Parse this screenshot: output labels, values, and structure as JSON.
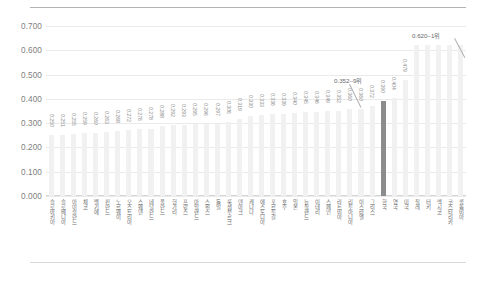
{
  "chart_data": {
    "type": "bar",
    "title": "",
    "xlabel": "",
    "ylabel": "",
    "ylim": [
      0.0,
      0.7
    ],
    "ytick_labels": [
      "0.700",
      "0.600",
      "0.500",
      "0.400",
      "0.300",
      "0.200",
      "0.100",
      "0.000"
    ],
    "ytick_values": [
      0.7,
      0.6,
      0.5,
      0.4,
      0.3,
      0.2,
      0.1,
      0.0
    ],
    "grid": true,
    "legend": "none",
    "highlight_category": "한국",
    "highlight_color": "#8c8c8c",
    "bar_color": "#f1f1f1",
    "categories": [
      "슬로바키아",
      "슬로베니아",
      "아이슬란드",
      "체코",
      "벨기에",
      "핀란드",
      "노르웨이",
      "오스트리아",
      "스웨덴",
      "네덜란드",
      "폴란드",
      "헝가리",
      "프랑스",
      "아일랜드",
      "스위스",
      "독일",
      "룩셈부르크",
      "덴마크",
      "캐나다",
      "에스토니아",
      "포르투갈",
      "호주",
      "일본",
      "뉴질랜드",
      "이태리",
      "스페인",
      "라트비아",
      "리투아니아",
      "이스라엘",
      "그리스",
      "한국",
      "영국",
      "미국",
      "칠레",
      "터키",
      "멕시코",
      "코스타리카",
      "콜롬비아"
    ],
    "values": [
      0.25,
      0.251,
      0.255,
      0.259,
      0.26,
      0.263,
      0.268,
      0.272,
      0.276,
      0.278,
      0.288,
      0.292,
      0.293,
      0.295,
      0.296,
      0.297,
      0.306,
      0.319,
      0.33,
      0.333,
      0.336,
      0.339,
      0.34,
      0.345,
      0.346,
      0.349,
      0.352,
      0.36,
      0.36,
      0.372,
      0.39,
      0.404,
      0.479,
      0.62,
      0.62,
      0.62,
      0.62,
      0.62
    ],
    "value_labels": [
      "0.250",
      "0.251",
      "0.255",
      "0.259",
      "0.260",
      "0.263",
      "0.268",
      "0.272",
      "0.276",
      "0.278",
      "0.288",
      "0.292",
      "0.293",
      "0.295",
      "0.296",
      "0.297",
      "0.306",
      "0.319",
      "0.330",
      "0.333",
      "0.336",
      "0.339",
      "0.340",
      "0.345",
      "0.346",
      "0.349",
      "0.352",
      "0.360",
      "0.360",
      "0.372",
      "0.390",
      "0.404",
      "0.479",
      "0.620",
      "0.620",
      "0.620",
      "0.620",
      "0.620"
    ],
    "annotations": [
      {
        "name": "rank-1-callout",
        "text": "0.620–1위",
        "value": 0.62
      },
      {
        "name": "korea-callout",
        "text": "0.352–9위",
        "value": 0.352
      }
    ]
  }
}
